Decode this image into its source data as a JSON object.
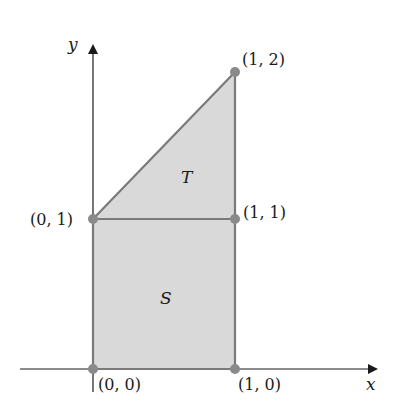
{
  "diagram": {
    "axes": {
      "x_label": "x",
      "y_label": "y"
    },
    "regions": [
      {
        "name": "S",
        "label": "S",
        "vertices": [
          [
            0,
            0
          ],
          [
            1,
            0
          ],
          [
            1,
            1
          ],
          [
            0,
            1
          ]
        ]
      },
      {
        "name": "T",
        "label": "T",
        "vertices": [
          [
            0,
            1
          ],
          [
            1,
            1
          ],
          [
            1,
            2
          ]
        ]
      }
    ],
    "points": [
      {
        "coord": [
          0,
          0
        ],
        "label": "(0, 0)"
      },
      {
        "coord": [
          1,
          0
        ],
        "label": "(1, 0)"
      },
      {
        "coord": [
          0,
          1
        ],
        "label": "(0, 1)"
      },
      {
        "coord": [
          1,
          1
        ],
        "label": "(1, 1)"
      },
      {
        "coord": [
          1,
          2
        ],
        "label": "(1, 2)"
      }
    ],
    "colors": {
      "fill": "#d9d9d9",
      "edge": "#7a7a7a",
      "point": "#8a8a8a",
      "axis": "#1a1a1a"
    }
  }
}
